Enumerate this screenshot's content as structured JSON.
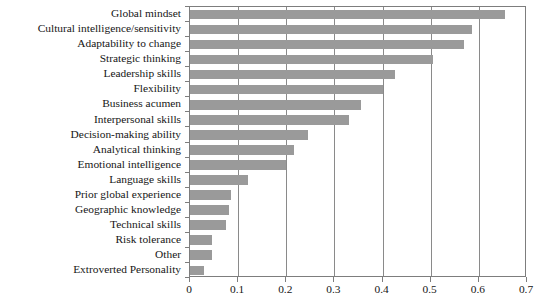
{
  "chart_data": {
    "type": "bar",
    "orientation": "horizontal",
    "title": "",
    "subtitle": "",
    "xlabel": "",
    "ylabel": "",
    "xlim": [
      0,
      0.7
    ],
    "grid": true,
    "legend": null,
    "bar_color": "#9a9a9a",
    "axis_color": "#7d7d7d",
    "text_color": "#161616",
    "background": "#ffffff",
    "xticks": [
      0,
      0.1,
      0.2,
      0.3,
      0.4,
      0.5,
      0.6,
      0.7
    ],
    "xticklabels": [
      "0",
      "0.1",
      "0.2",
      "0.3",
      "0.4",
      "0.5",
      "0.6",
      "0.7"
    ],
    "categories": [
      "Global mindset",
      "Cultural intelligence/sensitivity",
      "Adaptability to change",
      "Strategic thinking",
      "Leadership skills",
      "Flexibility",
      "Business acumen",
      "Interpersonal skills",
      "Decision-making ability",
      "Analytical thinking",
      "Emotional intelligence",
      "Language skills",
      "Prior global experience",
      "Geographic knowledge",
      "Technical skills",
      "Risk tolerance",
      "Other",
      "Extroverted Personality"
    ],
    "values": [
      0.655,
      0.585,
      0.57,
      0.505,
      0.425,
      0.4,
      0.355,
      0.33,
      0.245,
      0.215,
      0.2,
      0.12,
      0.085,
      0.08,
      0.075,
      0.045,
      0.045,
      0.03
    ]
  }
}
